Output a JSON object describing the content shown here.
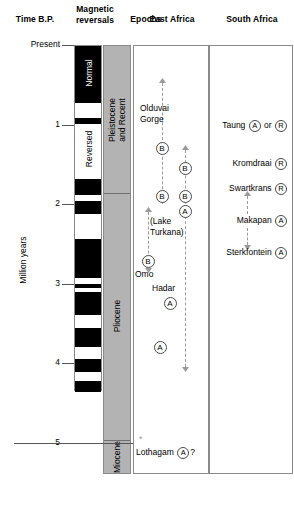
{
  "headers": {
    "time": "Time B.P.",
    "magnetic": "Magnetic\nreversals",
    "epochs": "Epochs",
    "east_africa": "East Africa",
    "south_africa": "South Africa"
  },
  "axis": {
    "title": "Million years",
    "unit": "million years",
    "ticks": [
      {
        "label": "Present",
        "value": 0
      },
      {
        "label": "1",
        "value": 1
      },
      {
        "label": "2",
        "value": 2
      },
      {
        "label": "3",
        "value": 3
      },
      {
        "label": "4",
        "value": 4
      },
      {
        "label": "5",
        "value": 5
      }
    ],
    "range": [
      0,
      5.4
    ]
  },
  "magnetic": {
    "polarity_labels": {
      "normal": "Normal",
      "reversed": "Reversed"
    },
    "column_range": [
      0,
      4.35
    ],
    "normal_intervals": [
      [
        0.0,
        0.72
      ],
      [
        0.9,
        0.98
      ],
      [
        1.67,
        1.87
      ],
      [
        1.95,
        2.11
      ],
      [
        2.43,
        2.92
      ],
      [
        2.99,
        3.05
      ],
      [
        3.09,
        3.38
      ],
      [
        3.55,
        3.78
      ],
      [
        3.94,
        4.1
      ],
      [
        4.22,
        4.35
      ]
    ]
  },
  "epochs": {
    "items": [
      {
        "name": "Pleistocene\nand Recent",
        "start": 0,
        "end": 1.85
      },
      {
        "name": "Pliocene",
        "start": 1.85,
        "end": 4.95
      },
      {
        "name": "Miocene",
        "start": 4.95,
        "end": 5.4
      }
    ]
  },
  "east_africa": {
    "sites": [
      {
        "name": "Olduvai\nGorge",
        "age": 0.95,
        "markers": []
      },
      {
        "name": "(Lake\nTurkana)",
        "age": 2.35,
        "markers": []
      },
      {
        "name": "Omo",
        "age": 2.85,
        "markers": []
      },
      {
        "name": "Hadar",
        "age": 3.05,
        "markers": []
      },
      {
        "name": "Lothagam",
        "age": 5.05,
        "markers": [
          "A"
        ],
        "query": "?",
        "asterisk": true
      }
    ],
    "taxon_markers": [
      {
        "letter": "B",
        "age": 1.3
      },
      {
        "letter": "B",
        "age": 1.55
      },
      {
        "letter": "B",
        "age": 1.9
      },
      {
        "letter": "B",
        "age": 1.9
      },
      {
        "letter": "A",
        "age": 2.1
      },
      {
        "letter": "B",
        "age": 2.72
      },
      {
        "letter": "A",
        "age": 3.25
      },
      {
        "letter": "A",
        "age": 3.8
      }
    ],
    "range_lines": [
      {
        "site": "Olduvai Gorge",
        "from": 0.48,
        "to": 2.0,
        "arrow_top": true
      },
      {
        "site": "Lake Turkana",
        "from": 1.32,
        "to": 3.02,
        "arrow_top": true
      },
      {
        "site": "Omo",
        "from": 2.1,
        "to": 2.8,
        "arrow_top": true,
        "arrow_bottom": true
      },
      {
        "site": "Hadar",
        "from": 2.92,
        "to": 4.05,
        "arrow_bottom": true
      }
    ]
  },
  "south_africa": {
    "sites": [
      {
        "name": "Taung",
        "age": 1.0,
        "markers": [
          "A",
          "R"
        ],
        "conjunction": "or"
      },
      {
        "name": "Kromdraai",
        "age": 1.48,
        "markers": [
          "R"
        ]
      },
      {
        "name": "Swartkrans",
        "age": 1.8,
        "markers": [
          "R"
        ]
      },
      {
        "name": "Makapan",
        "age": 2.2,
        "markers": [
          "A"
        ]
      },
      {
        "name": "Sterkfontein",
        "age": 2.6,
        "markers": [
          "A"
        ]
      }
    ],
    "range_lines": [
      {
        "site": "Swartkrans-Makapan",
        "from": 1.9,
        "to": 2.12,
        "arrow_top": true
      },
      {
        "site": "Makapan-Sterkfontein",
        "from": 2.3,
        "to": 2.52,
        "arrow_bottom": true
      }
    ]
  },
  "colors": {
    "normal_polarity": "#000000",
    "reversed_polarity": "#ffffff",
    "epoch_fill": "#b3b3b3",
    "frame": "#8a8a8a",
    "range_line": "#9a9a9a"
  }
}
